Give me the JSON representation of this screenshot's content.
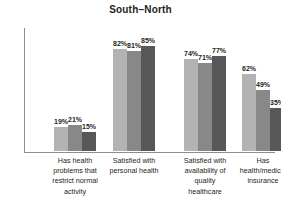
{
  "chart_data": {
    "type": "bar",
    "title": "South–North",
    "xlabel": "",
    "ylabel": "",
    "ylim": [
      0,
      100
    ],
    "grid": false,
    "legend": "none",
    "value_suffix": "%",
    "categories": [
      "Has health\nproblems that\nrestrict normal\nactivity",
      "Satisfied with\npersonal health",
      "Satisfied with\navailability of\nquality\nhealthcare",
      "Has\nhealth/medical\ninsurance"
    ],
    "series": [
      {
        "name": "series-1",
        "color": "#b3b3b3",
        "values": [
          19,
          82,
          74,
          62
        ]
      },
      {
        "name": "series-2",
        "color": "#888888",
        "values": [
          21,
          81,
          71,
          49
        ]
      },
      {
        "name": "series-3",
        "color": "#575757",
        "values": [
          15,
          85,
          77,
          35
        ]
      }
    ],
    "bars": [
      {
        "category_index": 0,
        "label": "19%",
        "value": 19,
        "color": "#b3b3b3"
      },
      {
        "category_index": 0,
        "label": "21%",
        "value": 21,
        "color": "#888888"
      },
      {
        "category_index": 0,
        "label": "15%",
        "value": 15,
        "color": "#575757"
      },
      {
        "category_index": 1,
        "label": "82%",
        "value": 82,
        "color": "#b3b3b3"
      },
      {
        "category_index": 1,
        "label": "81%",
        "value": 81,
        "color": "#888888"
      },
      {
        "category_index": 1,
        "label": "85%",
        "value": 85,
        "color": "#575757"
      },
      {
        "category_index": 2,
        "label": "74%",
        "value": 74,
        "color": "#b3b3b3"
      },
      {
        "category_index": 2,
        "label": "71%",
        "value": 71,
        "color": "#888888"
      },
      {
        "category_index": 2,
        "label": "77%",
        "value": 77,
        "color": "#575757"
      },
      {
        "category_index": 3,
        "label": "62%",
        "value": 62,
        "color": "#b3b3b3"
      },
      {
        "category_index": 3,
        "label": "49%",
        "value": 49,
        "color": "#888888"
      },
      {
        "category_index": 3,
        "label": "35%",
        "value": 35,
        "color": "#575757"
      }
    ],
    "axis_color": "#8e8e8e",
    "text_color": "#231f20"
  }
}
